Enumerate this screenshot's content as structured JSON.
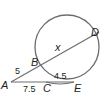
{
  "diagram": {
    "type": "circle-secants",
    "points": {
      "A": {
        "label": "A"
      },
      "B": {
        "label": "B"
      },
      "C": {
        "label": "C"
      },
      "D": {
        "label": "D"
      },
      "E": {
        "label": "E"
      }
    },
    "segments": {
      "AB": "5",
      "BD": "x",
      "AC": "7.5",
      "CE": "4.5"
    },
    "colors": {
      "circle": "#6d6e71",
      "line": "#6d6e71",
      "text": "#231f20"
    }
  }
}
